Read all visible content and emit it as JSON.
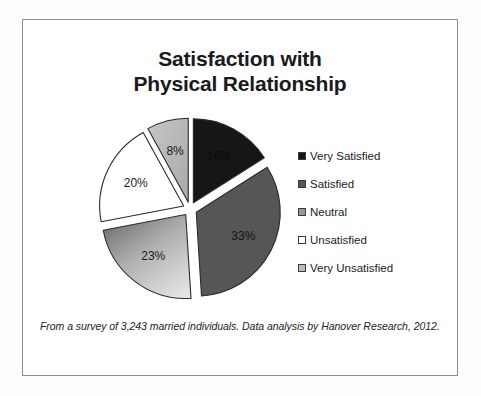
{
  "document": {
    "title_line1": "Satisfaction with",
    "title_line2": "Physical Relationship",
    "footnote": "From a survey of 3,243 married individuals. Data analysis by Hanover Research, 2012."
  },
  "legend": {
    "items": [
      {
        "label": "Very Satisfied",
        "color": "#161616"
      },
      {
        "label": "Satisfied",
        "color": "#565656"
      },
      {
        "label": "Neutral",
        "color": "#9a9a9a"
      },
      {
        "label": "Unsatisfied",
        "color": "#ffffff"
      },
      {
        "label": "Very Unsatisfied",
        "color": "#bcbcbc"
      }
    ]
  },
  "chart_data": {
    "type": "pie",
    "title": "Satisfaction with Physical Relationship",
    "categories": [
      "Very Satisfied",
      "Satisfied",
      "Neutral",
      "Unsatisfied",
      "Very Unsatisfied"
    ],
    "values": [
      16,
      33,
      23,
      20,
      8
    ],
    "value_unit": "%",
    "data_labels": [
      "16%",
      "33%",
      "23%",
      "20%",
      "8%"
    ],
    "colors": [
      "#161616",
      "#565656",
      "#9a9a9a",
      "#ffffff",
      "#bcbcbc"
    ],
    "exploded": true,
    "start_angle_deg": 0,
    "direction": "clockwise",
    "legend_position": "right",
    "grid": false,
    "annotation": "From a survey of 3,243 married individuals. Data analysis by Hanover Research, 2012."
  }
}
